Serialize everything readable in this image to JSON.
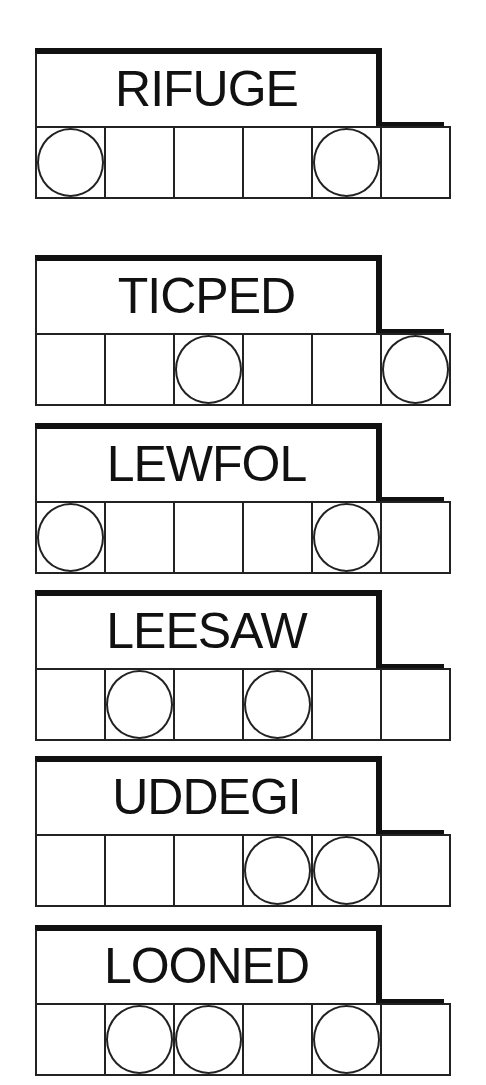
{
  "puzzle": {
    "type": "word-jumble",
    "colors": {
      "ink": "#111111",
      "background": "#ffffff"
    },
    "words": [
      {
        "scramble": "RIFUGE",
        "letters": 6,
        "circled_positions": [
          0,
          4
        ]
      },
      {
        "scramble": "TICPED",
        "letters": 6,
        "circled_positions": [
          2,
          5
        ]
      },
      {
        "scramble": "LEWFOL",
        "letters": 6,
        "circled_positions": [
          0,
          4
        ]
      },
      {
        "scramble": "LEESAW",
        "letters": 6,
        "circled_positions": [
          1,
          3
        ]
      },
      {
        "scramble": "UDDEGI",
        "letters": 6,
        "circled_positions": [
          3,
          4
        ]
      },
      {
        "scramble": "LOONED",
        "letters": 6,
        "circled_positions": [
          1,
          2,
          4
        ]
      }
    ]
  }
}
